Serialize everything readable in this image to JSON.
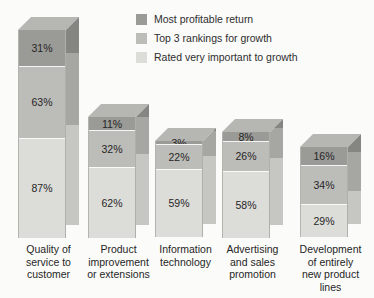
{
  "chart_data": {
    "type": "bar",
    "subtype": "stacked-bar-3d",
    "title": "",
    "subtitle": "",
    "xlabel": "",
    "ylabel": "",
    "grid": false,
    "legend_position": "top-center",
    "stacked": true,
    "value_suffix": "%",
    "categories": [
      "Quality of service to customer",
      "Product improvement or extensions",
      "Information technology",
      "Advertising and sales promotion",
      "Development of entirely new product lines"
    ],
    "category_lines": [
      [
        "Quality of",
        "service to",
        "customer"
      ],
      [
        "Product",
        "improvement",
        "or extensions"
      ],
      [
        "Information",
        "technology"
      ],
      [
        "Advertising",
        "and sales",
        "promotion"
      ],
      [
        "Development",
        "of entirely",
        "new product",
        "lines"
      ]
    ],
    "series": [
      {
        "name": "Most profitable return",
        "color": "#9a9a96",
        "values": [
          31,
          11,
          3,
          8,
          16
        ],
        "labels": [
          "31%",
          "11%",
          "3%",
          "8%",
          "16%"
        ]
      },
      {
        "name": "Top 3 rankings for growth",
        "color": "#bcbcb8",
        "values": [
          63,
          32,
          22,
          26,
          34
        ],
        "labels": [
          "63%",
          "32%",
          "22%",
          "26%",
          "34%"
        ]
      },
      {
        "name": "Rated very important to growth",
        "color": "#dcdcd8",
        "values": [
          87,
          62,
          59,
          58,
          29
        ],
        "labels": [
          "87%",
          "62%",
          "59%",
          "58%",
          "29%"
        ]
      }
    ],
    "stack_order_top_to_bottom": [
      "Most profitable return",
      "Top 3 rankings for growth",
      "Rated very important to growth"
    ],
    "stack_totals": [
      181,
      105,
      84,
      92,
      79
    ],
    "ylim": [
      0,
      181
    ]
  },
  "legend": {
    "items": [
      {
        "label": "Most profitable return",
        "color": "#9a9a96"
      },
      {
        "label": "Top 3 rankings for growth",
        "color": "#bcbcb8"
      },
      {
        "label": "Rated very important to growth",
        "color": "#dcdcd8"
      }
    ]
  },
  "palette": {
    "background": "#fbfbf9",
    "series_dark": "#9a9a96",
    "series_mid": "#bcbcb8",
    "series_light": "#dcdcd8",
    "side_dark": "#858581",
    "side_mid": "#a6a6a2",
    "side_light": "#c6c6c2",
    "top_dark": "#b6b6b2",
    "top_mid": "#cfcfcb",
    "top_light": "#e8e8e4",
    "text": "#262626"
  }
}
